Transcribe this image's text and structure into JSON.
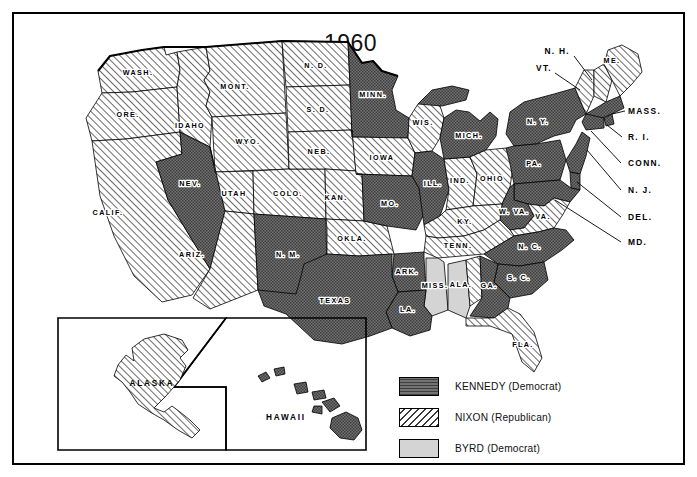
{
  "figure": {
    "title": "1960",
    "kind": "us-presidential-election-map"
  },
  "legend": {
    "items": [
      {
        "key": "kennedy",
        "label": "KENNEDY  (Democrat)",
        "pattern": "dark-crosshatch",
        "color": "#6b6b6b"
      },
      {
        "key": "nixon",
        "label": "NIXON  (Republican)",
        "pattern": "diagonal-hatch",
        "color": "#ffffff"
      },
      {
        "key": "byrd",
        "label": "BYRD  (Democrat)",
        "pattern": "solid-light",
        "color": "#d2d2d2"
      }
    ]
  },
  "inset": {
    "alaska_label": "ALASKA",
    "hawaii_label": "HAWAII"
  },
  "states": {
    "WASH": {
      "label": "WASH.",
      "winner": "nixon"
    },
    "ORE": {
      "label": "ORE.",
      "winner": "nixon"
    },
    "IDAHO": {
      "label": "IDAHO",
      "winner": "nixon"
    },
    "MONT": {
      "label": "MONT.",
      "winner": "nixon"
    },
    "ND": {
      "label": "N. D.",
      "winner": "nixon"
    },
    "MINN": {
      "label": "MINN.",
      "winner": "kennedy"
    },
    "WIS": {
      "label": "WIS.",
      "winner": "nixon"
    },
    "MICH": {
      "label": "MICH.",
      "winner": "kennedy"
    },
    "WYO": {
      "label": "WYO.",
      "winner": "nixon"
    },
    "SD": {
      "label": "S. D.",
      "winner": "nixon"
    },
    "IOWA": {
      "label": "IOWA",
      "winner": "nixon"
    },
    "NEV": {
      "label": "NEV.",
      "winner": "kennedy"
    },
    "UTAH": {
      "label": "UTAH",
      "winner": "nixon"
    },
    "COLO": {
      "label": "COLO.",
      "winner": "nixon"
    },
    "NEB": {
      "label": "NEB.",
      "winner": "nixon"
    },
    "ILL": {
      "label": "ILL.",
      "winner": "kennedy"
    },
    "IND": {
      "label": "IND.",
      "winner": "nixon"
    },
    "OHIO": {
      "label": "OHIO",
      "winner": "nixon"
    },
    "PA": {
      "label": "PA.",
      "winner": "kennedy"
    },
    "NY": {
      "label": "N. Y.",
      "winner": "kennedy"
    },
    "CALIF": {
      "label": "CALIF.",
      "winner": "nixon"
    },
    "KAN": {
      "label": "KAN.",
      "winner": "nixon"
    },
    "MO": {
      "label": "MO.",
      "winner": "kennedy"
    },
    "KY": {
      "label": "KY.",
      "winner": "nixon"
    },
    "WVA": {
      "label": "W. VA.",
      "winner": "kennedy"
    },
    "VA": {
      "label": "VA.",
      "winner": "nixon"
    },
    "ARIZ": {
      "label": "ARIZ.",
      "winner": "nixon"
    },
    "NM": {
      "label": "N. M.",
      "winner": "kennedy"
    },
    "OKLA": {
      "label": "OKLA.",
      "winner": "nixon"
    },
    "ARK": {
      "label": "ARK.",
      "winner": "kennedy"
    },
    "TENN": {
      "label": "TENN.",
      "winner": "nixon"
    },
    "NC": {
      "label": "N. C.",
      "winner": "kennedy"
    },
    "SC": {
      "label": "S. C.",
      "winner": "kennedy"
    },
    "MISS": {
      "label": "MISS.",
      "winner": "byrd"
    },
    "ALA": {
      "label": "ALA.",
      "winner": "byrd"
    },
    "GA": {
      "label": "GA.",
      "winner": "kennedy"
    },
    "TEXAS": {
      "label": "TEXAS",
      "winner": "kennedy"
    },
    "LA": {
      "label": "LA.",
      "winner": "kennedy"
    },
    "FLA": {
      "label": "FLA.",
      "winner": "nixon"
    },
    "ALASKA": {
      "label": "ALASKA",
      "winner": "nixon"
    },
    "HAWAII": {
      "label": "HAWAII",
      "winner": "kennedy"
    }
  },
  "callouts": {
    "NH": {
      "label": "N. H.",
      "winner": "nixon"
    },
    "VT": {
      "label": "VT.",
      "winner": "nixon"
    },
    "ME": {
      "label": "ME.",
      "winner": "nixon"
    },
    "MASS": {
      "label": "MASS.",
      "winner": "kennedy"
    },
    "RI": {
      "label": "R. I.",
      "winner": "kennedy"
    },
    "CONN": {
      "label": "CONN.",
      "winner": "kennedy"
    },
    "NJ": {
      "label": "N. J.",
      "winner": "kennedy"
    },
    "DEL": {
      "label": "DEL.",
      "winner": "kennedy"
    },
    "MD": {
      "label": "MD.",
      "winner": "kennedy"
    }
  }
}
